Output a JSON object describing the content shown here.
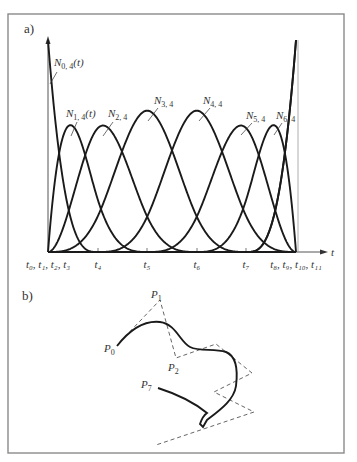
{
  "panels": {
    "a": {
      "label": "a)"
    },
    "b": {
      "label": "b)"
    }
  },
  "axis": {
    "t_label": "t"
  },
  "knot_labels": [
    {
      "text": "t₀, t₁, t₂, t₃",
      "x": 48
    },
    {
      "text": "t₄",
      "x": 98
    },
    {
      "text": "t₅",
      "x": 147
    },
    {
      "text": "t₆",
      "x": 197
    },
    {
      "text": "t₇",
      "x": 246
    },
    {
      "text": "t₈, t₉, t₁₀, t₁₁",
      "x": 296
    }
  ],
  "basis_labels": [
    {
      "name": "N0,4(t)",
      "main": "N",
      "sub": "0, 4",
      "suffix": "(t)"
    },
    {
      "name": "N1,4(t)",
      "main": "N",
      "sub": "1, 4",
      "suffix": "(t)"
    },
    {
      "name": "N2,4",
      "main": "N",
      "sub": "2, 4",
      "suffix": ""
    },
    {
      "name": "N3,4",
      "main": "N",
      "sub": "3, 4",
      "suffix": ""
    },
    {
      "name": "N4,4",
      "main": "N",
      "sub": "4, 4",
      "suffix": ""
    },
    {
      "name": "N5,4",
      "main": "N",
      "sub": "5, 4",
      "suffix": ""
    },
    {
      "name": "N6,4",
      "main": "N",
      "sub": "6, 4",
      "suffix": ""
    }
  ],
  "control_labels": [
    {
      "main": "P",
      "sub": "0"
    },
    {
      "main": "P",
      "sub": "1"
    },
    {
      "main": "P",
      "sub": "2"
    },
    {
      "main": "P",
      "sub": "7"
    }
  ],
  "chart_data": {
    "type": "line",
    "xlabel": "t",
    "ylabel": "",
    "knot_vector": [
      0,
      0,
      0,
      0,
      1,
      2,
      3,
      4,
      5,
      5,
      5,
      5
    ],
    "order": 4,
    "series": [
      {
        "name": "N0,4(t)"
      },
      {
        "name": "N1,4(t)"
      },
      {
        "name": "N2,4"
      },
      {
        "name": "N3,4"
      },
      {
        "name": "N4,4"
      },
      {
        "name": "N5,4"
      },
      {
        "name": "N6,4"
      }
    ],
    "grid": false,
    "legend": "inline labels with leader lines"
  }
}
